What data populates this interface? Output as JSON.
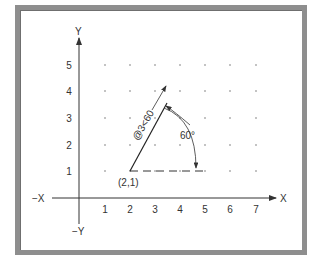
{
  "diagram": {
    "axes": {
      "x_label": "X",
      "neg_x_label": "−X",
      "y_label": "Y",
      "neg_y_label": "−Y",
      "x_ticks": [
        "1",
        "2",
        "3",
        "4",
        "5",
        "6",
        "7"
      ],
      "y_ticks": [
        "1",
        "2",
        "3",
        "4",
        "5"
      ]
    },
    "grid": {
      "x_range": [
        1,
        7
      ],
      "y_range": [
        1,
        5
      ],
      "style": "dots"
    },
    "start_point": {
      "label": "(2,1)",
      "x": 2,
      "y": 1
    },
    "polar_entry": {
      "label": "@3<60",
      "distance": 3,
      "angle_deg": 60
    },
    "angle_dimension": {
      "label": "60°"
    },
    "colors": {
      "frame": "#8e8e8e",
      "ink": "#333333",
      "background": "#ffffff"
    }
  }
}
